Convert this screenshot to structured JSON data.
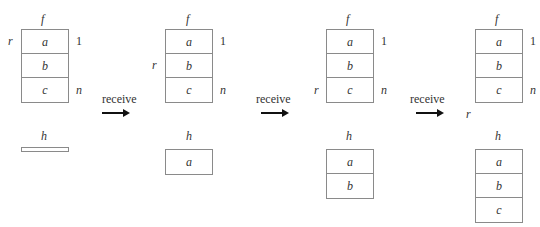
{
  "diagram": {
    "labels": {
      "f": "f",
      "h": "h",
      "r": "r",
      "one": "1",
      "n": "n"
    },
    "transition_label": "receive",
    "states": [
      {
        "f_cells": [
          "a",
          "b",
          "c"
        ],
        "r_row": 0,
        "h_cells": []
      },
      {
        "f_cells": [
          "a",
          "b",
          "c"
        ],
        "r_row": 1,
        "h_cells": [
          "a"
        ]
      },
      {
        "f_cells": [
          "a",
          "b",
          "c"
        ],
        "r_row": 2,
        "h_cells": [
          "a",
          "b"
        ]
      },
      {
        "f_cells": [
          "a",
          "b",
          "c"
        ],
        "r_row": 3,
        "h_cells": [
          "a",
          "b",
          "c"
        ]
      }
    ],
    "arrows": [
      {
        "label": "receive"
      },
      {
        "label": "receive"
      },
      {
        "label": "receive"
      }
    ]
  }
}
